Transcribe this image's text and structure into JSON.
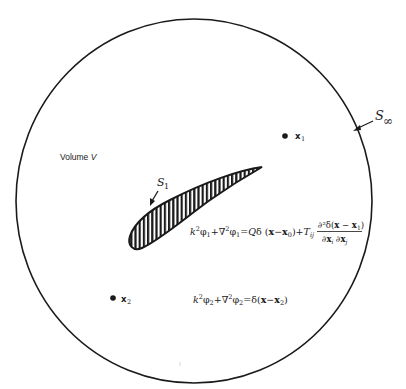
{
  "figure": {
    "volume_label": "Volume V",
    "volume_label_prefix": "Volume ",
    "volume_label_var": "V",
    "boundary_outer": {
      "symbol": "S",
      "subscript": "∞",
      "label": "S∞"
    },
    "boundary_inner": {
      "symbol": "S",
      "subscript": "1",
      "label": "S1"
    },
    "points": [
      {
        "id": "x1",
        "symbol": "x",
        "subscript": "1",
        "label": "x1"
      },
      {
        "id": "x2",
        "symbol": "x",
        "subscript": "2",
        "label": "x2"
      }
    ],
    "equation_1": {
      "lhs": "k²φ₁+∇²φ₁",
      "rhs_term1": "=Qδ(x−x₀)",
      "rhs_term2_coef": "+Tij",
      "fraction_numerator": "∂²δ(x − x₁)",
      "fraction_denominator": "∂xᵢ ∂xⱼ",
      "full": "k²φ₁+∇²φ₁=Qδ(x−x₀)+Tij ∂²δ(x−x₁)/∂xᵢ∂xⱼ"
    },
    "equation_2": {
      "lhs": "k²φ₂+∇²φ₂",
      "rhs": "=δ(x−x₂)",
      "full": "k²φ₂+∇²φ₂=δ(x−x₂)"
    },
    "colors": {
      "ink": "#1a1a1a",
      "background": "#ffffff"
    }
  }
}
